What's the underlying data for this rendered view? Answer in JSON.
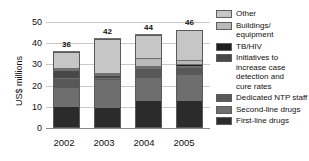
{
  "chart_data": {
    "type": "bar",
    "stacked": true,
    "title": "",
    "xlabel": "",
    "ylabel": "US$ millions",
    "categories": [
      "2002",
      "2003",
      "2004",
      "2005"
    ],
    "ylim": [
      0,
      50
    ],
    "yticks": [
      0,
      10,
      20,
      30,
      40,
      50
    ],
    "grid": true,
    "legend_position": "right",
    "totals": [
      36,
      42,
      44,
      46
    ],
    "total_labels": [
      "36",
      "42",
      "44",
      "46"
    ],
    "series": [
      {
        "name": "First-line drugs",
        "color": "#2b2b2b",
        "values": [
          10.5,
          9.8,
          13.3,
          13.0
        ]
      },
      {
        "name": "Second-line drugs",
        "color": "#6e6e6e",
        "values": [
          8.5,
          13.0,
          10.5,
          12.0
        ]
      },
      {
        "name": "Dedicated NTP staff",
        "color": "#585858",
        "values": [
          4.5,
          1.0,
          4.5,
          4.0
        ]
      },
      {
        "name": "Initiatives to increase case detection and cure rates",
        "color": "#474747",
        "values": [
          3.7,
          1.0,
          0.4,
          0.4
        ]
      },
      {
        "name": "TB/HIV",
        "color": "#1f1f1f",
        "values": [
          0.3,
          0.2,
          0.3,
          0.6
        ]
      },
      {
        "name": "Buildings/equipment",
        "color": "#b9b9b9",
        "values": [
          0.5,
          0.5,
          4.0,
          2.0
        ]
      },
      {
        "name": "Other",
        "color": "#c6c6c6",
        "values": [
          8.0,
          16.5,
          11.0,
          14.0
        ]
      }
    ],
    "legend_entries": [
      {
        "label": "Other",
        "color": "#c6c6c6"
      },
      {
        "label": "Buildings/ equipment",
        "color": "#b9b9b9"
      },
      {
        "label": "TB/HIV",
        "color": "#1f1f1f"
      },
      {
        "label": "Initiatives to increase case detection and cure rates",
        "color": "#474747"
      },
      {
        "label": "Dedicated NTP staff",
        "color": "#585858"
      },
      {
        "label": "Second-line drugs",
        "color": "#6e6e6e"
      },
      {
        "label": "First-line drugs",
        "color": "#2b2b2b"
      }
    ]
  },
  "axis": {
    "y_tick_50": "50",
    "y_tick_40": "40",
    "y_tick_30": "30",
    "y_tick_20": "20",
    "y_tick_10": "10",
    "y_tick_0": "0",
    "y_title": "US$ millions",
    "x_tick_0": "2002",
    "x_tick_1": "2003",
    "x_tick_2": "2004",
    "x_tick_3": "2005"
  },
  "labels": {
    "total_0": "36",
    "total_1": "42",
    "total_2": "44",
    "total_3": "46"
  },
  "legend": {
    "item_0": "Other",
    "item_1_line_0": "Buildings/",
    "item_1_line_1": "equipment",
    "item_2": "TB/HIV",
    "item_3_line_0": "Initiatives to",
    "item_3_line_1": "increase case",
    "item_3_line_2": "detection and",
    "item_3_line_3": "cure rates",
    "item_4": "Dedicated NTP staff",
    "item_5": "Second-line drugs",
    "item_6": "First-line drugs"
  }
}
